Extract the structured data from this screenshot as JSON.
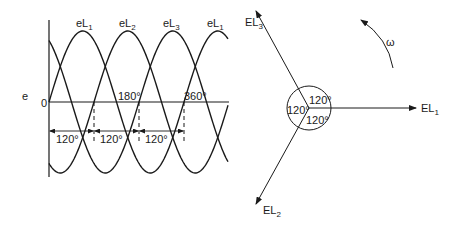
{
  "waveform": {
    "y_axis_label": "e",
    "origin_label": "0",
    "curve_labels": [
      {
        "name": "eL",
        "sub": "1"
      },
      {
        "name": "eL",
        "sub": "2"
      },
      {
        "name": "eL",
        "sub": "3"
      },
      {
        "name": "eL",
        "sub": "1"
      }
    ],
    "angle_markers": [
      "180°",
      "360°"
    ],
    "spacing_labels": [
      "120°",
      "120°",
      "120°"
    ],
    "phase_shift_deg": 120
  },
  "phasor": {
    "vectors": [
      {
        "name": "EL",
        "sub": "1",
        "angle_deg": 0
      },
      {
        "name": "EL",
        "sub": "2",
        "angle_deg": 240
      },
      {
        "name": "EL",
        "sub": "3",
        "angle_deg": 120
      }
    ],
    "angle_labels": [
      "120°",
      "120°",
      "120°"
    ],
    "rotation_label": "ω"
  },
  "colors": {
    "stroke": "#1a1a1a",
    "background": "#ffffff"
  }
}
